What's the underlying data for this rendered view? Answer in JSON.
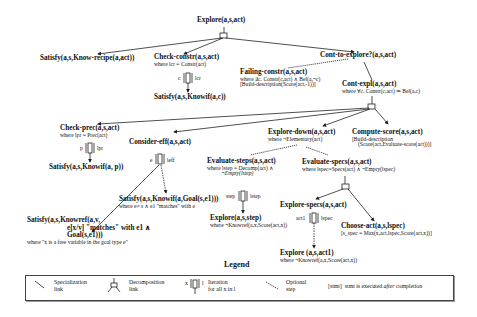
{
  "diagram": {
    "nodes": {
      "explore": {
        "title": "Explore(a,s,act)"
      },
      "satisfy_recipe": {
        "title": "Satisfy(a,s,Know-recipe(a,act))"
      },
      "check_constr": {
        "title": "Check-constr(a,s,act)",
        "cond": "where lcr = Constr(act)",
        "iter_var": "c",
        "iter_list": "lcr"
      },
      "satisfy_knowif_c": {
        "title": "Satisfy(a,s,Knowif(a,c))"
      },
      "cont_to_explore": {
        "title": "Cont-to-explore?(a,s,act)"
      },
      "failing_constr": {
        "title": "Failing-constr(a,s,act)",
        "cond": "where ∃c. Constr(c,act) ∧ Bel(a,¬c)",
        "post": "[Build-description(Score(act,-1))]"
      },
      "cont_expl": {
        "title": "Cont-expl(a,s,act)",
        "cond": "where ∀c. Constr(c,act) ⇒ Bel(a,c)"
      },
      "check_prec": {
        "title": "Check-prec(a,s,act)",
        "cond": "where lpr = Prec(act)",
        "iter_var": "p",
        "iter_list": "lpr"
      },
      "satisfy_knowif_p": {
        "title": "Satisfy(a,s,Knowif(a, p))"
      },
      "consider_eff": {
        "title": "Consider-eff(a,s,act)",
        "iter_var": "e",
        "iter_list": "leff"
      },
      "satisfy_knowif_goal": {
        "title": "Satisfy(a,s,Knowif(a,Goal(s,e1)))",
        "cond": "where e≠ s ∧ e1 \"matches\" with e"
      },
      "satisfy_knowref": {
        "title": "Satisfy(a,s,Knowref(a,v,",
        "line2": "e[x/v] \"matches\" with e1 ∧",
        "line3": "Goal(s,e1)))",
        "cond": "where \"x is a free variable in the goal type e\""
      },
      "explore_down": {
        "title": "Explore-down(a,s,act)",
        "cond": "where ¬Elementary(act)"
      },
      "compute_score": {
        "title": "Compute-score(a,s,act)",
        "post1": "[Build-description",
        "post2": "(Score(act,Evaluate-score(act)))]"
      },
      "evaluate_steps": {
        "title": "Evaluate-steps(a,s,act)",
        "cond": "where lstep = Decomp(act) ∧",
        "cond2": "¬Empty(lstep)",
        "iter_var": "step",
        "iter_list": "lstep"
      },
      "explore_step": {
        "title": "Explore(a,s,step)",
        "cond": "where ¬Knowref(a,x,Score(act,x))"
      },
      "evaluate_specs": {
        "title": "Evaluate-specs(a,s,act)",
        "cond": "where lspec=Specs(act) ∧ ¬Empty(lspec)"
      },
      "explore_specs": {
        "title": "Explore-specs(a,s,act)",
        "iter_var": "act1",
        "iter_list": "lspec"
      },
      "explore_act1": {
        "title": "Explore (a,s,act1)",
        "cond": "where ¬Knowref(a,x,Score(act,x))"
      },
      "choose_act": {
        "title": "Choose-act(a,s,lspec)",
        "post": "[s_spec = Max(x,act,lspec,Score(act,x))]"
      }
    }
  },
  "legend": {
    "title": "Legend",
    "items": [
      {
        "icon": "specialization-link-icon",
        "label1": "Specialization",
        "label2": "link"
      },
      {
        "icon": "decomposition-link-icon",
        "label1": "Decomposition",
        "label2": "link"
      },
      {
        "icon": "iteration-icon",
        "var": "x",
        "list": "l",
        "label1": "Iteration",
        "label2": "for all x in l"
      },
      {
        "icon": "optional-step-icon",
        "label1": "Optional",
        "label2": "step"
      },
      {
        "code": "[stmt]",
        "label_pre": "stmt is executed ",
        "label_em": "after",
        "label_post": " completion"
      }
    ]
  },
  "colors": {
    "line": "#222222",
    "background": "#ffffff"
  }
}
